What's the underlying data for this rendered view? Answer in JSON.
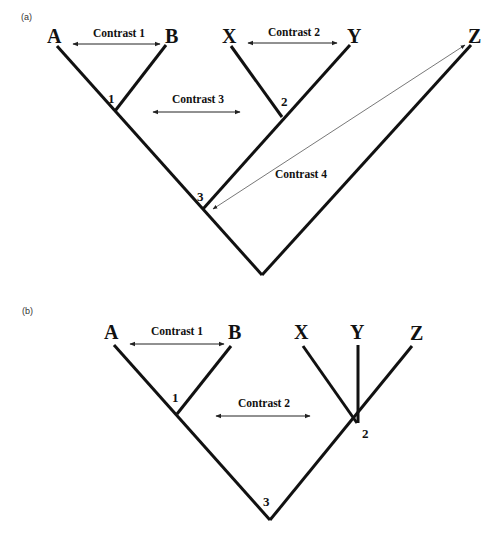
{
  "panels": [
    {
      "label": "(a)",
      "taxa": [
        "A",
        "B",
        "X",
        "Y",
        "Z"
      ],
      "nodes": [
        "1",
        "2",
        "3"
      ],
      "contrasts": [
        "Contrast 1",
        "Contrast 2",
        "Contrast 3",
        "Contrast 4"
      ]
    },
    {
      "label": "(b)",
      "taxa": [
        "A",
        "B",
        "X",
        "Y",
        "Z"
      ],
      "nodes": [
        "1",
        "2",
        "3"
      ],
      "contrasts": [
        "Contrast 1",
        "Contrast 2"
      ]
    }
  ]
}
